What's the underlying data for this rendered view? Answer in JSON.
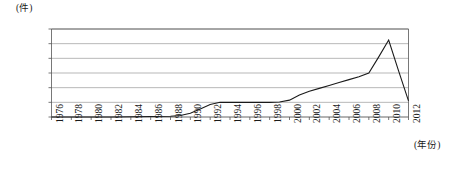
{
  "chart_data": {
    "type": "line",
    "title": "",
    "subtitle": "",
    "xlabel": "(年份)",
    "ylabel": "(件)",
    "ylim": [
      0,
      12000
    ],
    "xlim": [
      1976,
      2012
    ],
    "grid": true,
    "legend": null,
    "ytick_labels": [
      "12000",
      "10000",
      "8000",
      "6000",
      "4000",
      "2000",
      "0"
    ],
    "ytick_values": [
      12000,
      10000,
      8000,
      6000,
      4000,
      2000,
      0
    ],
    "xtick_labels": [
      "1976",
      "1978",
      "1980",
      "1982",
      "1984",
      "1986",
      "1988",
      "1990",
      "1992",
      "1994",
      "1996",
      "1998",
      "2000",
      "2002",
      "2004",
      "2006",
      "2008",
      "2010",
      "2012"
    ],
    "x": [
      1976,
      1978,
      1980,
      1982,
      1984,
      1986,
      1988,
      1989,
      1990,
      1991,
      1992,
      1993,
      1994,
      1995,
      1996,
      1997,
      1998,
      1999,
      2000,
      2001,
      2002,
      2003,
      2004,
      2005,
      2006,
      2007,
      2008,
      2009,
      2010,
      2011,
      2012
    ],
    "values": [
      0,
      0,
      0,
      0,
      30,
      60,
      100,
      200,
      500,
      1100,
      1700,
      2000,
      2000,
      2000,
      2000,
      2000,
      2000,
      2050,
      2300,
      3000,
      3500,
      3900,
      4300,
      4700,
      5100,
      5500,
      6000,
      8200,
      10500,
      6300,
      2200
    ],
    "series": [
      {
        "name": "数量",
        "color": "#1a1a1a",
        "values": [
          0,
          0,
          0,
          0,
          30,
          60,
          100,
          200,
          500,
          1100,
          1700,
          2000,
          2000,
          2000,
          2000,
          2000,
          2000,
          2050,
          2300,
          3000,
          3500,
          3900,
          4300,
          4700,
          5100,
          5500,
          6000,
          8200,
          10500,
          6300,
          2200
        ]
      }
    ],
    "annotations": [],
    "colors": {
      "line": "#1a1a1a",
      "grid": "#9a9a9a",
      "axis": "#555555",
      "background": "#ffffff"
    }
  }
}
